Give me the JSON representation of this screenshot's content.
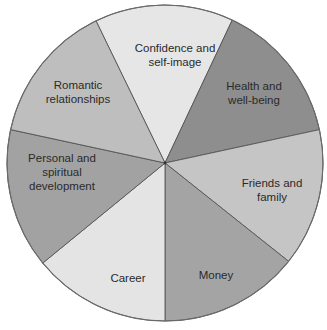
{
  "chart_data": {
    "type": "pie",
    "title": "",
    "categories": [
      "Confidence and self-image",
      "Health and well-being",
      "Friends and family",
      "Money",
      "Career",
      "Personal and spiritual development",
      "Romantic relationships"
    ],
    "values": [
      1,
      1,
      1,
      1,
      1,
      1,
      1
    ],
    "start_angle_deg": -25.9,
    "direction": "clockwise",
    "slices": [
      {
        "label": "Confidence and self-image",
        "label_lines": [
          "Confidence and",
          "self-image"
        ],
        "start": -25.9,
        "end": 25.2,
        "color": "#e6e6e6",
        "label_pos": [
          175,
          55
        ]
      },
      {
        "label": "Health and well-being",
        "label_lines": [
          "Health and",
          "well-being"
        ],
        "start": 25.2,
        "end": 77.8,
        "color": "#8e8e8e",
        "label_pos": [
          254,
          93
        ]
      },
      {
        "label": "Friends and family",
        "label_lines": [
          "Friends and",
          "family"
        ],
        "start": 77.8,
        "end": 128.5,
        "color": "#c5c5c5",
        "label_pos": [
          272,
          190
        ]
      },
      {
        "label": "Money",
        "label_lines": [
          "Money"
        ],
        "start": 128.5,
        "end": 180,
        "color": "#a4a4a4",
        "label_pos": [
          216,
          275
        ]
      },
      {
        "label": "Career",
        "label_lines": [
          "Career"
        ],
        "start": 180,
        "end": 230.7,
        "color": "#e4e4e4",
        "label_pos": [
          128,
          278
        ]
      },
      {
        "label": "Personal and spiritual development",
        "label_lines": [
          "Personal and",
          "spiritual",
          "development"
        ],
        "start": 230.7,
        "end": 282.2,
        "color": "#a2a2a2",
        "label_pos": [
          62,
          172
        ]
      },
      {
        "label": "Romantic relationships",
        "label_lines": [
          "Romantic",
          "relationships"
        ],
        "start": 282.2,
        "end": 334.1,
        "color": "#bebebe",
        "label_pos": [
          78,
          92
        ]
      }
    ],
    "legend": "none",
    "center": [
      165,
      163
    ],
    "radius": 158
  }
}
